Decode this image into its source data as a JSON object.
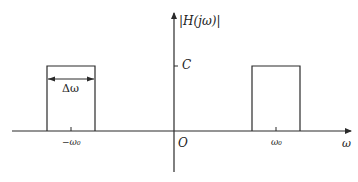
{
  "diagram": {
    "title_label": "|H(jω)|",
    "y_level_label": "C",
    "bandwidth_label": "Δω",
    "origin_label": "O",
    "x_axis_label": "ω",
    "neg_center_label": "−ω₀",
    "pos_center_label": "ω₀",
    "stroke_color": "#2a2a2a"
  }
}
